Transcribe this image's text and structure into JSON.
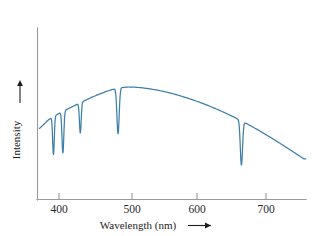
{
  "figure": {
    "background_color": "#ffffff",
    "line_color": "#3d7fa8",
    "axis_color": "#9a9a9a",
    "text_color": "#1d1d1d"
  },
  "axes": {
    "x_label": "Wavelength (nm)",
    "x_label_arrow": "⟶",
    "y_label": "Intensity",
    "y_label_arrow": "↑"
  },
  "chart_data": {
    "type": "line",
    "title": "",
    "xlabel": "Wavelength (nm)",
    "ylabel": "Intensity",
    "xlim": [
      375,
      745
    ],
    "ylim": [
      0,
      1
    ],
    "grid": false,
    "legend": null,
    "xticks": [
      400,
      500,
      600,
      700
    ],
    "xtick_labels": [
      "400",
      "500",
      "600",
      "700"
    ],
    "yticks": [],
    "ytick_labels": [],
    "continuum": {
      "comment": "Smooth background intensity vs wavelength in nm, normalized 0-1",
      "x": [
        378,
        390,
        400,
        410,
        420,
        430,
        440,
        450,
        460,
        470,
        480,
        490,
        500,
        510,
        520,
        530,
        540,
        550,
        560,
        570,
        580,
        590,
        600,
        610,
        620,
        630,
        640,
        650,
        660,
        670,
        680,
        690,
        700,
        710,
        720,
        730,
        742
      ],
      "y": [
        0.565,
        0.632,
        0.668,
        0.7,
        0.728,
        0.757,
        0.785,
        0.812,
        0.836,
        0.858,
        0.876,
        0.888,
        0.893,
        0.891,
        0.886,
        0.878,
        0.868,
        0.856,
        0.842,
        0.826,
        0.808,
        0.789,
        0.768,
        0.746,
        0.722,
        0.697,
        0.67,
        0.642,
        0.612,
        0.581,
        0.548,
        0.514,
        0.479,
        0.443,
        0.406,
        0.368,
        0.323
      ]
    },
    "absorption_lines": [
      {
        "name": "H-eta / Ca II H-K blend",
        "wavelength": 397,
        "depth": 0.3,
        "half_width": 1.6
      },
      {
        "name": "H-delta",
        "wavelength": 410,
        "depth": 0.33,
        "half_width": 1.8
      },
      {
        "name": "H-gamma",
        "wavelength": 434,
        "depth": 0.24,
        "half_width": 1.7
      },
      {
        "name": "H-beta",
        "wavelength": 486,
        "depth": 0.36,
        "half_width": 2.2
      },
      {
        "name": "H-alpha",
        "wavelength": 656,
        "depth": 0.35,
        "half_width": 2.2
      }
    ]
  }
}
